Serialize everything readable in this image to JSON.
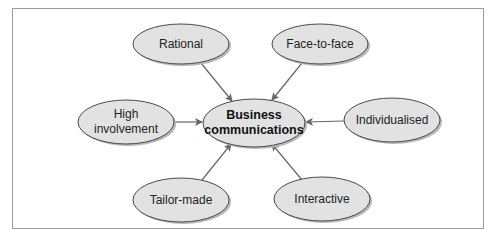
{
  "diagram": {
    "type": "hub-and-spoke",
    "colors": {
      "node_fill": "#e2e2e2",
      "node_stroke": "#4a4a4a",
      "arrow": "#666666",
      "frame": "#9a9a9a",
      "shadow": "#b8b8b8"
    },
    "center": {
      "id": "business-communications",
      "line1": "Business",
      "line2": "communications",
      "cx": 254,
      "cy": 123,
      "rx": 51,
      "ry": 24
    },
    "nodes": [
      {
        "id": "rational",
        "line1": "Rational",
        "line2": "",
        "cx": 181,
        "cy": 44,
        "rx": 48,
        "ry": 20
      },
      {
        "id": "face-to-face",
        "line1": "Face-to-face",
        "line2": "",
        "cx": 320,
        "cy": 44,
        "rx": 48,
        "ry": 20
      },
      {
        "id": "high-involvement",
        "line1": "High",
        "line2": "involvement",
        "cx": 126,
        "cy": 122,
        "rx": 48,
        "ry": 22
      },
      {
        "id": "individualised",
        "line1": "Individualised",
        "line2": "",
        "cx": 392,
        "cy": 120,
        "rx": 48,
        "ry": 22
      },
      {
        "id": "tailor-made",
        "line1": "Tailor-made",
        "line2": "",
        "cx": 181,
        "cy": 200,
        "rx": 48,
        "ry": 22
      },
      {
        "id": "interactive",
        "line1": "Interactive",
        "line2": "",
        "cx": 322,
        "cy": 199,
        "rx": 48,
        "ry": 22
      }
    ],
    "edges": [
      {
        "from": "rational",
        "to": "business-communications",
        "x1": 201,
        "y1": 63,
        "x2": 232,
        "y2": 101
      },
      {
        "from": "face-to-face",
        "to": "business-communications",
        "x1": 302,
        "y1": 63,
        "x2": 272,
        "y2": 100
      },
      {
        "from": "high-involvement",
        "to": "business-communications",
        "x1": 174,
        "y1": 122,
        "x2": 202,
        "y2": 122
      },
      {
        "from": "individualised",
        "to": "business-communications",
        "x1": 344,
        "y1": 121,
        "x2": 306,
        "y2": 122
      },
      {
        "from": "tailor-made",
        "to": "business-communications",
        "x1": 202,
        "y1": 180,
        "x2": 231,
        "y2": 144
      },
      {
        "from": "interactive",
        "to": "business-communications",
        "x1": 302,
        "y1": 180,
        "x2": 272,
        "y2": 144
      }
    ]
  }
}
